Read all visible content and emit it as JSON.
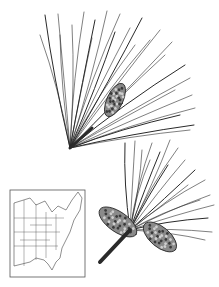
{
  "illustration": {
    "subject": "pine branches with needles and cones",
    "background": "#ffffff",
    "ink": "#2a2a2a",
    "upper_branch": {
      "base": [
        70,
        148
      ],
      "needle_tips": [
        [
          45,
          15
        ],
        [
          58,
          14
        ],
        [
          72,
          25
        ],
        [
          84,
          12
        ],
        [
          95,
          20
        ],
        [
          107,
          11
        ],
        [
          120,
          14
        ],
        [
          130,
          28
        ],
        [
          142,
          18
        ],
        [
          150,
          40
        ],
        [
          160,
          30
        ],
        [
          172,
          42
        ],
        [
          185,
          65
        ],
        [
          190,
          78
        ],
        [
          192,
          95
        ],
        [
          195,
          108
        ],
        [
          194,
          125
        ],
        [
          40,
          35
        ],
        [
          60,
          35
        ],
        [
          92,
          38
        ],
        [
          115,
          32
        ],
        [
          135,
          45
        ],
        [
          165,
          55
        ],
        [
          175,
          90
        ],
        [
          180,
          115
        ],
        [
          190,
          130
        ]
      ],
      "cluster": {
        "cx": 115,
        "cy": 100,
        "rx": 8,
        "ry": 18,
        "rotate": 25
      }
    },
    "lower_branch": {
      "base": [
        100,
        262
      ],
      "needle_tips": [
        [
          125,
          143
        ],
        [
          135,
          141
        ],
        [
          142,
          150
        ],
        [
          152,
          143
        ],
        [
          160,
          152
        ],
        [
          170,
          140
        ],
        [
          178,
          148
        ],
        [
          185,
          160
        ],
        [
          195,
          170
        ],
        [
          205,
          180
        ],
        [
          210,
          195
        ],
        [
          214,
          205
        ],
        [
          208,
          218
        ],
        [
          212,
          232
        ],
        [
          205,
          240
        ],
        [
          150,
          160
        ],
        [
          168,
          165
        ],
        [
          188,
          185
        ],
        [
          200,
          200
        ]
      ],
      "cones": [
        {
          "cx": 118,
          "cy": 222,
          "rx": 22,
          "ry": 10,
          "rotate": 35
        },
        {
          "cx": 160,
          "cy": 237,
          "rx": 20,
          "ry": 10,
          "rotate": 40
        }
      ]
    },
    "map": {
      "frame": {
        "x": 10,
        "y": 190,
        "w": 75,
        "h": 87
      },
      "region": "Eastern United States range map"
    }
  }
}
